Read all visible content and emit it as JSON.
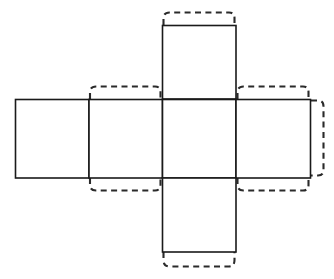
{
  "diagram": {
    "background_color": "#ffffff",
    "solid_line_color": "#1a1a1a",
    "dashed_line_color": "#2a2a2a",
    "solid_line_width": 1.6,
    "dashed_line_width": 2.1,
    "dash_pattern": "6 4.4",
    "canvas": {
      "width": 334,
      "height": 279
    },
    "grid": {
      "columns_x": [
        15,
        89,
        162,
        236,
        311
      ],
      "rows_y": [
        25,
        99,
        178,
        252
      ],
      "face_width": 74,
      "face_height": 79
    },
    "faces": [
      {
        "name": "left-face",
        "x": 15,
        "y": 99,
        "w": 74,
        "h": 79
      },
      {
        "name": "left-center-face",
        "x": 89,
        "y": 99,
        "w": 73,
        "h": 79
      },
      {
        "name": "center-face",
        "x": 162,
        "y": 99,
        "w": 74,
        "h": 79
      },
      {
        "name": "right-face",
        "x": 236,
        "y": 99,
        "w": 75,
        "h": 79
      },
      {
        "name": "top-face",
        "x": 162,
        "y": 25,
        "w": 74,
        "h": 74
      },
      {
        "name": "bottom-face",
        "x": 162,
        "y": 178,
        "w": 74,
        "h": 74
      }
    ],
    "tabs": [
      {
        "name": "tab-top-face-top",
        "edge": "top",
        "attached_to": "top-face",
        "depth": 13
      },
      {
        "name": "tab-left-center-face-top",
        "edge": "top",
        "attached_to": "left-center-face",
        "depth": 13
      },
      {
        "name": "tab-left-center-face-bottom",
        "edge": "bottom",
        "attached_to": "left-center-face",
        "depth": 13
      },
      {
        "name": "tab-right-face-top",
        "edge": "top",
        "attached_to": "right-face",
        "depth": 13
      },
      {
        "name": "tab-right-face-bottom",
        "edge": "bottom",
        "attached_to": "right-face",
        "depth": 13
      },
      {
        "name": "tab-right-face-right",
        "edge": "right",
        "attached_to": "right-face",
        "depth": 14
      },
      {
        "name": "tab-bottom-face-bottom",
        "edge": "bottom",
        "attached_to": "bottom-face",
        "depth": 16
      }
    ]
  }
}
